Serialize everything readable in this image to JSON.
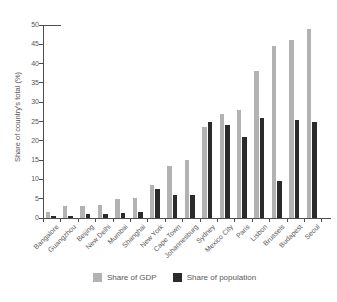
{
  "figure": {
    "kind": "scanned-book-bar-chart"
  },
  "legend": [
    {
      "label": "Share of GDP",
      "color": "#b2b2b2"
    },
    {
      "label": "Share of population",
      "color": "#2b2b2b"
    }
  ],
  "chart_data": {
    "type": "bar",
    "title": "",
    "xlabel": "",
    "ylabel": "Share of country's total (%)",
    "ylim": [
      0,
      50
    ],
    "ytick_step": 5,
    "grid": false,
    "legend_position": "bottom",
    "categories": [
      "Bangalore",
      "Guangzhou",
      "Beijing",
      "New Delhi",
      "Mumbai",
      "Shanghai",
      "New York",
      "Cape Town",
      "Johannesburg",
      "Sydney",
      "Mexico City",
      "Paris",
      "Lisbon",
      "Brussels",
      "Budapest",
      "Seoul"
    ],
    "series": [
      {
        "name": "Share of GDP",
        "color": "#b2b2b2",
        "values": [
          1.6,
          3.0,
          3.1,
          3.4,
          5.0,
          5.2,
          8.5,
          13.5,
          15.0,
          23.5,
          27.0,
          28.0,
          38.0,
          44.5,
          46.0,
          49.0
        ]
      },
      {
        "name": "Share of population",
        "color": "#2b2b2b",
        "values": [
          0.5,
          0.6,
          1.0,
          1.0,
          1.2,
          1.6,
          7.5,
          6.0,
          6.0,
          25.0,
          24.0,
          21.0,
          26.0,
          9.5,
          25.5,
          25.0
        ]
      }
    ]
  }
}
